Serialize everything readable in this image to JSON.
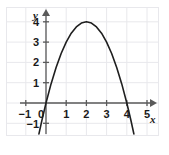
{
  "chart_data": {
    "type": "line",
    "title": "",
    "subtitle": "",
    "xlabel": "x",
    "ylabel": "y",
    "equation": "y = -x^2 + 4x",
    "xlim": [
      -1.6,
      5.9
    ],
    "ylim": [
      -1.6,
      4.9
    ],
    "grid": true,
    "grid_color": "#e8e8ec",
    "legend": null,
    "axis_color": "#5a5a5a",
    "curve_color": "#1f1f1f",
    "x_ticks": [
      {
        "value": -1,
        "label": "−1"
      },
      {
        "value": 0,
        "label": "0"
      },
      {
        "value": 1,
        "label": "1"
      },
      {
        "value": 2,
        "label": "2"
      },
      {
        "value": 3,
        "label": "3"
      },
      {
        "value": 4,
        "label": "4"
      },
      {
        "value": 5,
        "label": "5"
      }
    ],
    "y_ticks": [
      {
        "value": -1,
        "label": "−1"
      },
      {
        "value": 1,
        "label": "1"
      },
      {
        "value": 2,
        "label": "2"
      },
      {
        "value": 3,
        "label": "3"
      },
      {
        "value": 4,
        "label": "4"
      }
    ],
    "vertex": {
      "x": 2,
      "y": 4
    },
    "roots": [
      0,
      4
    ],
    "x": [
      -0.35,
      -0.2,
      0,
      0.25,
      0.5,
      0.75,
      1,
      1.25,
      1.5,
      1.75,
      2,
      2.25,
      2.5,
      2.75,
      3,
      3.25,
      3.5,
      3.75,
      4,
      4.2,
      4.35
    ],
    "y": [
      -1.52,
      -0.84,
      0,
      0.94,
      1.75,
      2.44,
      3,
      3.44,
      3.75,
      3.94,
      4,
      3.94,
      3.75,
      3.44,
      3,
      2.44,
      1.75,
      0.94,
      0,
      -0.84,
      -1.52
    ],
    "series": [
      {
        "name": "parabola",
        "color": "#1f1f1f",
        "values": [
          -1.52,
          -0.84,
          0,
          0.94,
          1.75,
          2.44,
          3,
          3.44,
          3.75,
          3.94,
          4,
          3.94,
          3.75,
          3.44,
          3,
          2.44,
          1.75,
          0.94,
          0,
          -0.84,
          -1.52
        ]
      }
    ]
  }
}
